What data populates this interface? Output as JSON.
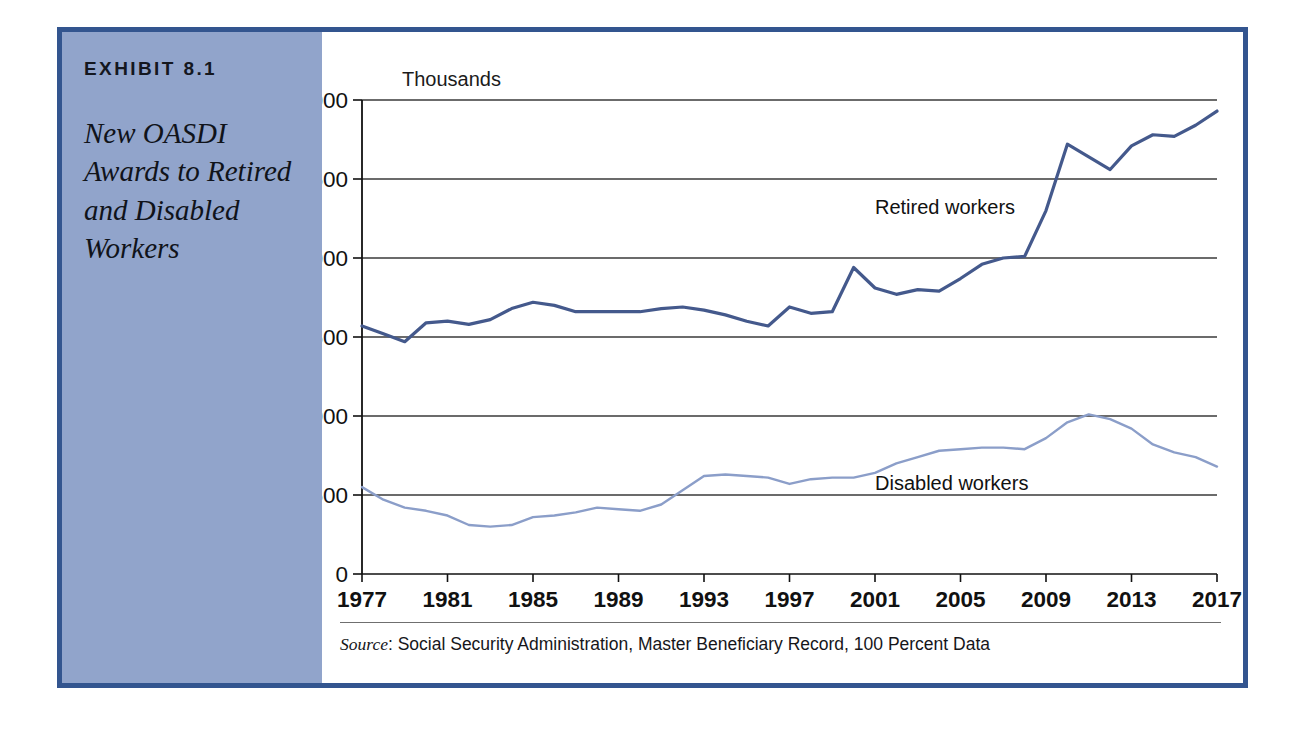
{
  "exhibit": {
    "number_label": "EXHIBIT 8.1",
    "title": "New OASDI Awards to Retired and Disabled Workers"
  },
  "colors": {
    "frame_border": "#33558f",
    "caption_panel": "#91a4cb",
    "retired_line": "#44598c",
    "disabled_line": "#8b9ec9",
    "gridline": "#3a3a3a",
    "axis": "#111111"
  },
  "source": {
    "prefix": "Source",
    "text": ": Social Security Administration, Master Beneficiary Record, 100 Percent Data"
  },
  "chart_data": {
    "type": "line",
    "title": "New OASDI Awards to Retired and Disabled Workers",
    "units_label": "Thousands",
    "xlabel": "",
    "ylabel": "Thousands",
    "xlim": [
      1977,
      2017
    ],
    "ylim": [
      0,
      3000
    ],
    "ytick_values": [
      0,
      500,
      1000,
      1500,
      2000,
      2500,
      3000
    ],
    "ytick_labels": [
      "0",
      "500",
      "1,000",
      "1,500",
      "2,000",
      "2,500",
      "3,000"
    ],
    "xtick_values": [
      1977,
      1981,
      1985,
      1989,
      1993,
      1997,
      2001,
      2005,
      2009,
      2013,
      2017
    ],
    "xtick_labels": [
      "1977",
      "1981",
      "1985",
      "1989",
      "1993",
      "1997",
      "2001",
      "2005",
      "2009",
      "2013",
      "2017"
    ],
    "grid": "horizontal",
    "legend_position": "inline-right",
    "x": [
      1977,
      1978,
      1979,
      1980,
      1981,
      1982,
      1983,
      1984,
      1985,
      1986,
      1987,
      1988,
      1989,
      1990,
      1991,
      1992,
      1993,
      1994,
      1995,
      1996,
      1997,
      1998,
      1999,
      2000,
      2001,
      2002,
      2003,
      2004,
      2005,
      2006,
      2007,
      2008,
      2009,
      2010,
      2011,
      2012,
      2013,
      2014,
      2015,
      2016,
      2017
    ],
    "series": [
      {
        "name": "Retired workers",
        "color": "#44598c",
        "label_x": 2001,
        "label_y": 2280,
        "values": [
          1570,
          1520,
          1470,
          1590,
          1600,
          1580,
          1610,
          1680,
          1720,
          1700,
          1660,
          1660,
          1660,
          1660,
          1680,
          1690,
          1670,
          1640,
          1600,
          1570,
          1690,
          1650,
          1660,
          1940,
          1810,
          1770,
          1800,
          1790,
          1870,
          1960,
          2000,
          2010,
          2300,
          2720,
          2640,
          2560,
          2710,
          2780,
          2770,
          2840,
          2930
        ]
      },
      {
        "name": "Disabled workers",
        "color": "#8b9ec9",
        "label_x": 2001,
        "label_y": 530,
        "values": [
          550,
          470,
          420,
          400,
          370,
          310,
          300,
          310,
          360,
          370,
          390,
          420,
          410,
          400,
          440,
          530,
          620,
          630,
          620,
          610,
          570,
          600,
          610,
          610,
          640,
          700,
          740,
          780,
          790,
          800,
          800,
          790,
          860,
          960,
          1010,
          980,
          920,
          820,
          770,
          740,
          680
        ]
      }
    ]
  }
}
